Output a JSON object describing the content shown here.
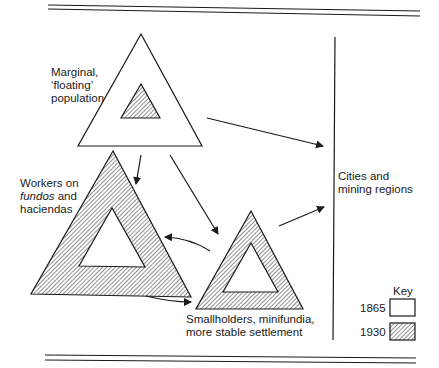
{
  "diagram": {
    "nodes": {
      "marginal": {
        "lines": [
          "Marginal,",
          "‘floating’",
          "population"
        ]
      },
      "workers": {
        "line1": "Workers on",
        "line2_italic": "fundos",
        "line2_rest": " and",
        "line3": "haciendas"
      },
      "smallholders": {
        "lines": [
          "Smallholders, minifundia,",
          "more stable settlement"
        ]
      },
      "cities": {
        "lines": [
          "Cities and",
          "mining regions"
        ]
      }
    },
    "key": {
      "title": "Key",
      "items": [
        {
          "label": "1865",
          "style": "outline"
        },
        {
          "label": "1930",
          "style": "hatched"
        }
      ]
    },
    "edges": [
      {
        "from": "marginal",
        "to": "cities"
      },
      {
        "from": "marginal",
        "to": "workers"
      },
      {
        "from": "marginal",
        "to": "smallholders"
      },
      {
        "from": "smallholders",
        "to": "workers"
      },
      {
        "from": "workers",
        "to": "smallholders"
      },
      {
        "from": "smallholders",
        "to": "cities"
      }
    ],
    "colors": {
      "ink": "#1a1a1a",
      "paper": "#ffffff"
    }
  }
}
